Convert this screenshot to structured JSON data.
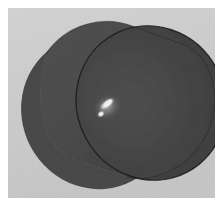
{
  "image": {
    "title": "Photograph of a dark cylindrical object",
    "domain": "Natural-Image",
    "width_px": 223,
    "height_px": 206,
    "color_mode": "grayscale",
    "border": {
      "name": "white-photo-margin",
      "color": "#ffffff",
      "top_px": 8,
      "right_px": 8,
      "bottom_px": 8,
      "left_px": 8
    }
  },
  "background": {
    "name": "studio-backdrop",
    "color": "#c8c8c8",
    "color_light": "#d2d2d2",
    "color_dark": "#bdbdbd",
    "texture": "fine film grain"
  },
  "subject": {
    "name": "cylinder",
    "description": "dark matte cylinder viewed obliquely, front circular face toward viewer, lower-left",
    "body_color": "#454545",
    "front_face_color": "#3f3f3f",
    "front_face_color_dark": "#363636",
    "outline_color": "#1c1c1c",
    "shadow_edge_color": "#2a2a2a",
    "rim_highlight_color": "#5a5a5a"
  },
  "geometry": {
    "back_face": {
      "name": "back-ellipse",
      "cx": 88,
      "cy": 104,
      "rx": 74,
      "ry": 78,
      "rotation_deg": -28
    },
    "front_face": {
      "name": "front-ellipse",
      "cx": 143,
      "cy": 95,
      "rx": 74,
      "ry": 78,
      "rotation_deg": -28
    },
    "body_span": {
      "name": "cylinder-body",
      "from": "back-ellipse",
      "to": "front-ellipse"
    }
  },
  "specular_highlight": {
    "name": "specular-highlight",
    "core_color": "#f2f2f2",
    "mid_color": "#bdbdbd",
    "glow_color": "#8a8a8a",
    "streak": {
      "cx": 99,
      "cy": 96,
      "rx": 9,
      "ry": 4,
      "rotation_deg": -38
    },
    "dot": {
      "cx": 93,
      "cy": 106,
      "rx": 4,
      "ry": 3,
      "rotation_deg": -38
    }
  },
  "lighting": {
    "name": "lighting-setup",
    "key_direction": "upper-left",
    "description": "single small key light producing a compact specular streak on the front face"
  }
}
